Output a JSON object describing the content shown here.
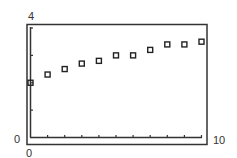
{
  "chart_data": {
    "type": "scatter",
    "title": "",
    "xlabel": "",
    "ylabel": "",
    "xlim": [
      0,
      10
    ],
    "ylim": [
      0,
      4
    ],
    "grid": false,
    "legend": null,
    "marker": "hollow-square",
    "x_tick_count": 10,
    "y_tick_count": 4,
    "tick_labels": {
      "y_max": "4",
      "y_min": "0",
      "x_min": "0",
      "x_max": "10"
    },
    "points": [
      {
        "x": 0,
        "y": 2.0
      },
      {
        "x": 1,
        "y": 2.3
      },
      {
        "x": 2,
        "y": 2.5
      },
      {
        "x": 3,
        "y": 2.7
      },
      {
        "x": 4,
        "y": 2.8
      },
      {
        "x": 5,
        "y": 3.0
      },
      {
        "x": 6,
        "y": 3.0
      },
      {
        "x": 7,
        "y": 3.2
      },
      {
        "x": 8,
        "y": 3.4
      },
      {
        "x": 9,
        "y": 3.4
      },
      {
        "x": 10,
        "y": 3.5
      }
    ],
    "colors": {
      "frame": "#333333",
      "marker": "#222222",
      "background": "#ffffff"
    }
  }
}
